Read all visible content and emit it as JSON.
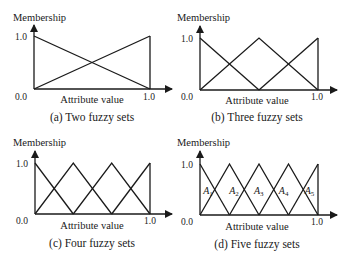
{
  "figure": {
    "panels": [
      {
        "id": "a",
        "caption": "(a) Two fuzzy sets",
        "ylabel": "Membership",
        "xlabel": "Attribute value",
        "y_top_tick": "1.0",
        "origin_tick": "0.0",
        "x_end_tick": "1.0",
        "n_sets": 2
      },
      {
        "id": "b",
        "caption": "(b) Three fuzzy sets",
        "ylabel": "Membership",
        "xlabel": "Attribute value",
        "y_top_tick": "1.0",
        "origin_tick": "0.0",
        "x_end_tick": "1.0",
        "n_sets": 3
      },
      {
        "id": "c",
        "caption": "(c) Four fuzzy sets",
        "ylabel": "Membership",
        "xlabel": "Attribute value",
        "y_top_tick": "1.0",
        "origin_tick": "0.0",
        "x_end_tick": "1.0",
        "n_sets": 4
      },
      {
        "id": "d",
        "caption": "(d) Five fuzzy sets",
        "ylabel": "Membership",
        "xlabel": "Attribute value",
        "y_top_tick": "1.0",
        "origin_tick": "0.0",
        "x_end_tick": "1.0",
        "n_sets": 5,
        "set_labels": [
          {
            "base": "A",
            "sub": "1"
          },
          {
            "base": "A",
            "sub": "2"
          },
          {
            "base": "A",
            "sub": "3"
          },
          {
            "base": "A",
            "sub": "4"
          },
          {
            "base": "A",
            "sub": "5"
          }
        ]
      }
    ]
  },
  "chart_data": [
    {
      "type": "line",
      "title": "(a) Two fuzzy sets",
      "xlabel": "Attribute value",
      "ylabel": "Membership",
      "xlim": [
        0.0,
        1.0
      ],
      "ylim": [
        0.0,
        1.0
      ],
      "series": [
        {
          "name": "set 1",
          "x": [
            0.0,
            1.0
          ],
          "values": [
            1.0,
            0.0
          ]
        },
        {
          "name": "set 2",
          "x": [
            0.0,
            1.0
          ],
          "values": [
            0.0,
            1.0
          ]
        }
      ]
    },
    {
      "type": "line",
      "title": "(b) Three fuzzy sets",
      "xlabel": "Attribute value",
      "ylabel": "Membership",
      "xlim": [
        0.0,
        1.0
      ],
      "ylim": [
        0.0,
        1.0
      ],
      "series": [
        {
          "name": "set 1",
          "x": [
            0.0,
            0.5
          ],
          "values": [
            1.0,
            0.0
          ]
        },
        {
          "name": "set 2",
          "x": [
            0.0,
            0.5,
            1.0
          ],
          "values": [
            0.0,
            1.0,
            0.0
          ]
        },
        {
          "name": "set 3",
          "x": [
            0.5,
            1.0
          ],
          "values": [
            0.0,
            1.0
          ]
        }
      ]
    },
    {
      "type": "line",
      "title": "(c) Four fuzzy sets",
      "xlabel": "Attribute value",
      "ylabel": "Membership",
      "xlim": [
        0.0,
        1.0
      ],
      "ylim": [
        0.0,
        1.0
      ],
      "series": [
        {
          "name": "set 1",
          "x": [
            0.0,
            0.333
          ],
          "values": [
            1.0,
            0.0
          ]
        },
        {
          "name": "set 2",
          "x": [
            0.0,
            0.333,
            0.667
          ],
          "values": [
            0.0,
            1.0,
            0.0
          ]
        },
        {
          "name": "set 3",
          "x": [
            0.333,
            0.667,
            1.0
          ],
          "values": [
            0.0,
            1.0,
            0.0
          ]
        },
        {
          "name": "set 4",
          "x": [
            0.667,
            1.0
          ],
          "values": [
            0.0,
            1.0
          ]
        }
      ]
    },
    {
      "type": "line",
      "title": "(d) Five fuzzy sets",
      "xlabel": "Attribute value",
      "ylabel": "Membership",
      "xlim": [
        0.0,
        1.0
      ],
      "ylim": [
        0.0,
        1.0
      ],
      "series": [
        {
          "name": "A1",
          "x": [
            0.0,
            0.25
          ],
          "values": [
            1.0,
            0.0
          ]
        },
        {
          "name": "A2",
          "x": [
            0.0,
            0.25,
            0.5
          ],
          "values": [
            0.0,
            1.0,
            0.0
          ]
        },
        {
          "name": "A3",
          "x": [
            0.25,
            0.5,
            0.75
          ],
          "values": [
            0.0,
            1.0,
            0.0
          ]
        },
        {
          "name": "A4",
          "x": [
            0.5,
            0.75,
            1.0
          ],
          "values": [
            0.0,
            1.0,
            0.0
          ]
        },
        {
          "name": "A5",
          "x": [
            0.75,
            1.0
          ],
          "values": [
            0.0,
            1.0
          ]
        }
      ]
    }
  ]
}
